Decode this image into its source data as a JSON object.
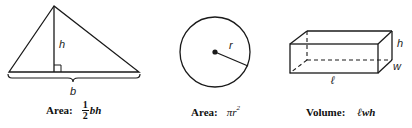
{
  "figures": {
    "triangle": {
      "labels": {
        "height": "h",
        "base": "b"
      },
      "formula": {
        "word": "Area:",
        "fraction_numerator": "1",
        "fraction_denominator": "2",
        "expression": "bh"
      }
    },
    "circle": {
      "labels": {
        "radius": "r"
      },
      "formula": {
        "word": "Area:",
        "expression": "πr",
        "exponent": "2"
      }
    },
    "box": {
      "labels": {
        "length": "ℓ",
        "width": "w",
        "height": "h"
      },
      "formula": {
        "word": "Volume:",
        "expression": "ℓwh"
      }
    }
  },
  "colors": {
    "stroke": "#1a1a1a",
    "background": "#ffffff"
  }
}
